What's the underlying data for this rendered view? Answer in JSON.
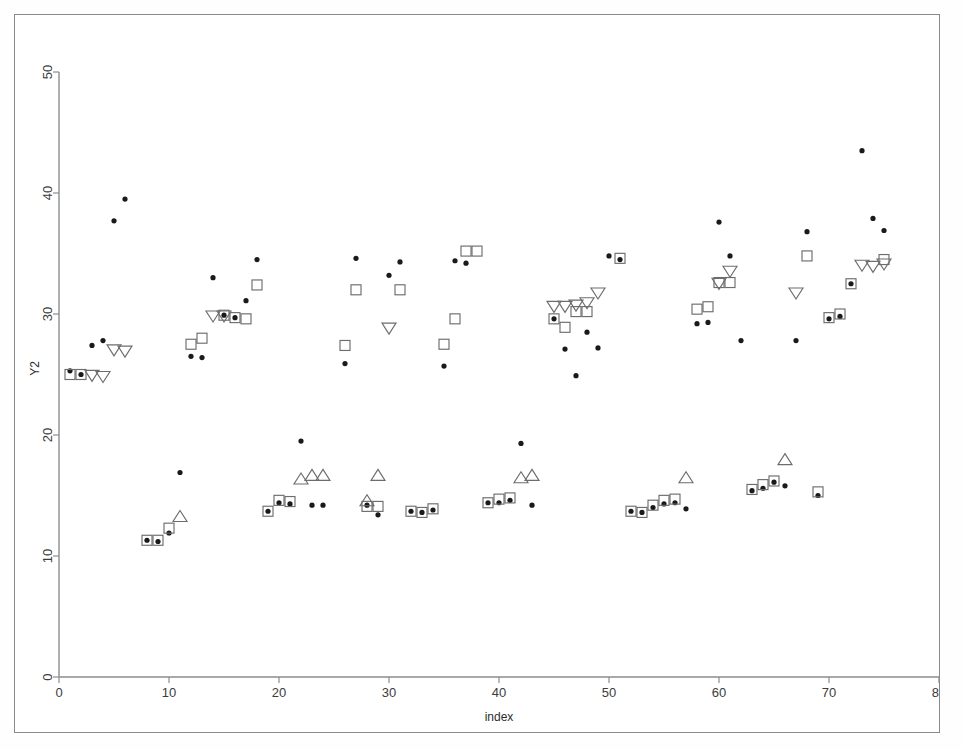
{
  "figure": {
    "background_color": "#ffffff",
    "frame_color": "#8a8a8a"
  },
  "chart_data": {
    "type": "scatter",
    "title": "",
    "xlabel": "index",
    "ylabel": "Y2",
    "xlim": [
      0,
      80
    ],
    "ylim": [
      0,
      50
    ],
    "xticks": [
      0,
      10,
      20,
      30,
      40,
      50,
      60,
      70,
      80
    ],
    "yticks": [
      0,
      10,
      20,
      30,
      40,
      50
    ],
    "grid": false,
    "legend": "none",
    "colors": {
      "dot": "#1a1a1a",
      "square": "#6d6d6d",
      "triangle": "#6d6d6d"
    },
    "series": [
      {
        "name": "dot",
        "marker": "filled-circle",
        "points": [
          [
            1,
            25.3
          ],
          [
            2,
            25.0
          ],
          [
            3,
            27.4
          ],
          [
            4,
            27.8
          ],
          [
            5,
            37.7
          ],
          [
            6,
            39.5
          ],
          [
            8,
            11.3
          ],
          [
            9,
            11.2
          ],
          [
            10,
            11.9
          ],
          [
            11,
            16.9
          ],
          [
            12,
            26.5
          ],
          [
            13,
            26.4
          ],
          [
            14,
            33.0
          ],
          [
            15,
            29.9
          ],
          [
            16,
            29.7
          ],
          [
            17,
            31.1
          ],
          [
            18,
            34.5
          ],
          [
            19,
            13.7
          ],
          [
            20,
            14.4
          ],
          [
            21,
            14.3
          ],
          [
            22,
            19.5
          ],
          [
            23,
            14.2
          ],
          [
            24,
            14.2
          ],
          [
            26,
            25.9
          ],
          [
            27,
            34.6
          ],
          [
            28,
            14.2
          ],
          [
            29,
            13.4
          ],
          [
            30,
            33.2
          ],
          [
            31,
            34.3
          ],
          [
            32,
            13.7
          ],
          [
            33,
            13.6
          ],
          [
            34,
            13.8
          ],
          [
            35,
            25.7
          ],
          [
            36,
            34.4
          ],
          [
            37,
            34.2
          ],
          [
            39,
            14.4
          ],
          [
            40,
            14.4
          ],
          [
            41,
            14.6
          ],
          [
            42,
            19.3
          ],
          [
            43,
            14.2
          ],
          [
            45,
            29.6
          ],
          [
            46,
            27.1
          ],
          [
            47,
            24.9
          ],
          [
            48,
            28.5
          ],
          [
            49,
            27.2
          ],
          [
            50,
            34.8
          ],
          [
            51,
            34.5
          ],
          [
            52,
            13.7
          ],
          [
            53,
            13.6
          ],
          [
            54,
            14.0
          ],
          [
            55,
            14.3
          ],
          [
            56,
            14.4
          ],
          [
            57,
            13.9
          ],
          [
            58,
            29.2
          ],
          [
            59,
            29.3
          ],
          [
            60,
            37.6
          ],
          [
            61,
            34.8
          ],
          [
            62,
            27.8
          ],
          [
            63,
            15.4
          ],
          [
            64,
            15.6
          ],
          [
            65,
            16.1
          ],
          [
            66,
            15.8
          ],
          [
            67,
            27.8
          ],
          [
            68,
            36.8
          ],
          [
            69,
            15.0
          ],
          [
            70,
            29.6
          ],
          [
            71,
            29.8
          ],
          [
            72,
            32.5
          ],
          [
            73,
            43.5
          ],
          [
            74,
            37.9
          ],
          [
            75,
            36.9
          ]
        ]
      },
      {
        "name": "square",
        "marker": "open-square",
        "points": [
          [
            1,
            25.0
          ],
          [
            2,
            25.0
          ],
          [
            8,
            11.3
          ],
          [
            9,
            11.3
          ],
          [
            10,
            12.3
          ],
          [
            12,
            27.5
          ],
          [
            13,
            28.0
          ],
          [
            15,
            29.9
          ],
          [
            16,
            29.7
          ],
          [
            17,
            29.6
          ],
          [
            18,
            32.4
          ],
          [
            19,
            13.7
          ],
          [
            20,
            14.6
          ],
          [
            21,
            14.5
          ],
          [
            26,
            27.4
          ],
          [
            27,
            32.0
          ],
          [
            28,
            14.1
          ],
          [
            29,
            14.1
          ],
          [
            31,
            32.0
          ],
          [
            32,
            13.7
          ],
          [
            33,
            13.6
          ],
          [
            34,
            13.9
          ],
          [
            35,
            27.5
          ],
          [
            36,
            29.6
          ],
          [
            37,
            35.2
          ],
          [
            38,
            35.2
          ],
          [
            39,
            14.4
          ],
          [
            40,
            14.7
          ],
          [
            41,
            14.8
          ],
          [
            45,
            29.6
          ],
          [
            46,
            28.9
          ],
          [
            47,
            30.2
          ],
          [
            48,
            30.2
          ],
          [
            51,
            34.6
          ],
          [
            52,
            13.7
          ],
          [
            53,
            13.6
          ],
          [
            54,
            14.2
          ],
          [
            55,
            14.6
          ],
          [
            56,
            14.7
          ],
          [
            58,
            30.4
          ],
          [
            59,
            30.6
          ],
          [
            60,
            32.6
          ],
          [
            61,
            32.6
          ],
          [
            63,
            15.5
          ],
          [
            64,
            15.9
          ],
          [
            65,
            16.2
          ],
          [
            68,
            34.8
          ],
          [
            69,
            15.3
          ],
          [
            70,
            29.7
          ],
          [
            71,
            30.0
          ],
          [
            72,
            32.5
          ],
          [
            75,
            34.5
          ]
        ]
      },
      {
        "name": "triangle",
        "marker": "open-triangle",
        "points": [
          [
            3,
            25.0
          ],
          [
            4,
            24.9
          ],
          [
            5,
            27.1
          ],
          [
            6,
            27.0
          ],
          [
            11,
            13.2
          ],
          [
            14,
            29.9
          ],
          [
            15,
            29.9
          ],
          [
            22,
            16.3
          ],
          [
            23,
            16.6
          ],
          [
            24,
            16.6
          ],
          [
            29,
            16.6
          ],
          [
            28,
            14.5
          ],
          [
            30,
            28.9
          ],
          [
            42,
            16.4
          ],
          [
            43,
            16.6
          ],
          [
            45,
            30.7
          ],
          [
            46,
            30.7
          ],
          [
            47,
            30.8
          ],
          [
            48,
            31.0
          ],
          [
            49,
            31.8
          ],
          [
            57,
            16.4
          ],
          [
            60,
            32.6
          ],
          [
            61,
            33.6
          ],
          [
            66,
            17.9
          ],
          [
            67,
            31.8
          ],
          [
            73,
            34.1
          ],
          [
            74,
            34.0
          ],
          [
            75,
            34.2
          ]
        ],
        "orientation_note": "down-pointing above Y2=20, up-pointing below Y2=20"
      }
    ]
  }
}
